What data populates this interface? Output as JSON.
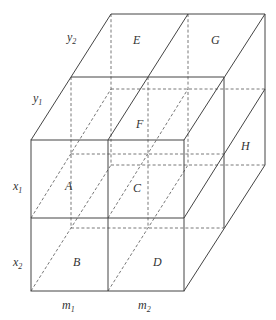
{
  "diagram": {
    "title": "",
    "cell_labels": [
      {
        "text": "A",
        "x": 65,
        "y": 190
      },
      {
        "text": "B",
        "x": 73,
        "y": 266
      },
      {
        "text": "C",
        "x": 133,
        "y": 192
      },
      {
        "text": "D",
        "x": 153,
        "y": 266
      },
      {
        "text": "E",
        "x": 133,
        "y": 44
      },
      {
        "text": "F",
        "x": 138,
        "y": 128
      },
      {
        "text": "G",
        "x": 213,
        "y": 44
      },
      {
        "text": "H",
        "x": 245,
        "y": 150
      }
    ],
    "axis_labels": {
      "rows": [
        {
          "base": "x",
          "sub": "1",
          "x": 13,
          "y": 190
        },
        {
          "base": "x",
          "sub": "2",
          "x": 13,
          "y": 266
        }
      ],
      "columns": [
        {
          "base": "m",
          "sub": "1",
          "x": 62,
          "y": 310
        },
        {
          "base": "m",
          "sub": "2",
          "x": 138,
          "y": 310
        }
      ],
      "depth": [
        {
          "base": "y",
          "sub": "1",
          "x": 33,
          "y": 104
        },
        {
          "base": "y",
          "sub": "2",
          "x": 67,
          "y": 42
        }
      ]
    },
    "line_color": "#444444"
  }
}
